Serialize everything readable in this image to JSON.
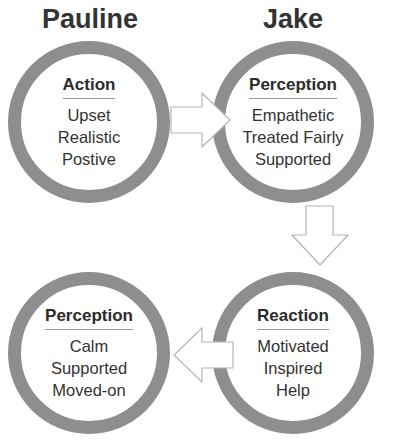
{
  "diagram": {
    "people": [
      {
        "name": "Pauline"
      },
      {
        "name": "Jake"
      }
    ],
    "nodes": [
      {
        "id": "pauline-action",
        "title": "Action",
        "items": [
          "Upset",
          "Realistic",
          "Postive"
        ]
      },
      {
        "id": "jake-perception",
        "title": "Perception",
        "items": [
          "Empathetic",
          "Treated Fairly",
          "Supported"
        ]
      },
      {
        "id": "jake-reaction",
        "title": "Reaction",
        "items": [
          "Motivated",
          "Inspired",
          "Help"
        ]
      },
      {
        "id": "pauline-perception",
        "title": "Perception",
        "items": [
          "Calm",
          "Supported",
          "Moved-on"
        ]
      }
    ],
    "flow": [
      {
        "from": "pauline-action",
        "to": "jake-perception",
        "direction": "right"
      },
      {
        "from": "jake-perception",
        "to": "jake-reaction",
        "direction": "down"
      },
      {
        "from": "jake-reaction",
        "to": "pauline-perception",
        "direction": "left"
      }
    ],
    "colors": {
      "ring": "#8e8e8e",
      "arrow_stroke": "#b5b5b5",
      "text": "#333333"
    }
  }
}
